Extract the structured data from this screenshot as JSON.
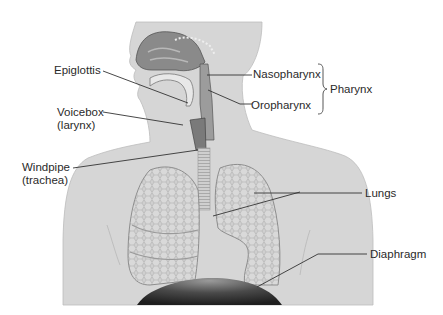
{
  "diagram": {
    "labels": {
      "epiglottis": "Epiglottis",
      "voicebox_line1": "Voicebox",
      "voicebox_line2": "(larynx)",
      "windpipe_line1": "Windpipe",
      "windpipe_line2": "(trachea)",
      "nasopharynx": "Nasopharynx",
      "oropharynx": "Oropharynx",
      "pharynx": "Pharynx",
      "lungs": "Lungs",
      "diaphragm": "Diaphragm"
    },
    "colors": {
      "body": "#d4d4d4",
      "body_edge": "#b4b4b4",
      "cavity": "#8c8c8c",
      "lung": "#c9c9c9",
      "lung_edge": "#9a9a9a",
      "diaphragm": "#3a3a3a",
      "leader_line": "#333333",
      "text": "#2a2a2a"
    }
  }
}
